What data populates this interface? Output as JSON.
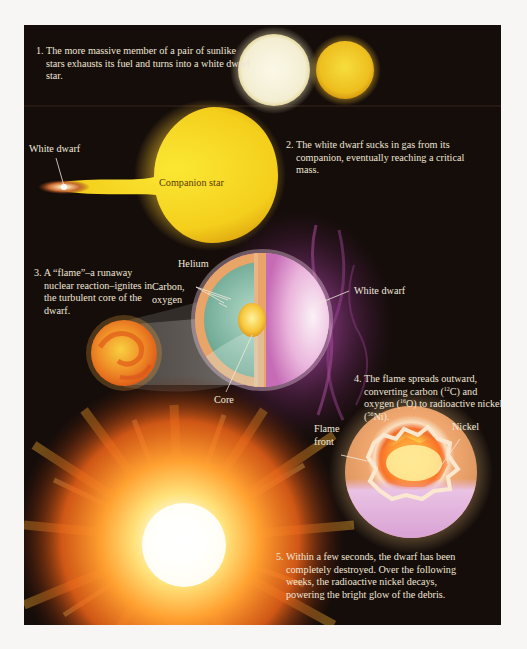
{
  "figure": {
    "colors": {
      "background": "#150d0a",
      "white_star": "#f6f2dc",
      "yellow_star": "#efc020",
      "helium_shell": "#e9a468",
      "carbon_oxygen_layer": "#7bb59e",
      "core": "#f5c640",
      "plasma_glow": "#d070c0",
      "explosion": "#ff7a1a"
    }
  },
  "steps": [
    {
      "number": "1.",
      "text": "The more massive member of a pair of sunlike stars exhausts its fuel and turns into a white dwarf star."
    },
    {
      "number": "2.",
      "text": "The white dwarf sucks in gas from its companion, eventually reaching a critical mass."
    },
    {
      "number": "3.",
      "text": "A “flame”–a runaway nuclear reaction–ignites in the turbulent core of the dwarf."
    },
    {
      "number": "4.",
      "text_before_c": "The flame spreads outward, converting carbon (",
      "c_iso": "12",
      "text_c": "C) and oxygen (",
      "o_iso": "16",
      "text_o": "O) to radioactive nickel (",
      "ni_iso": "56",
      "text_ni": "Ni)."
    },
    {
      "number": "5.",
      "text": "Within a few seconds, the dwarf has been completely destroyed. Over the following weeks, the radioactive nickel decays, powering the bright glow of the debris."
    }
  ],
  "labels": {
    "white_dwarf_top": "White dwarf",
    "companion_star": "Companion star",
    "helium": "Helium",
    "carbon_oxygen": "Carbon,\noxygen",
    "carbon": "Carbon,",
    "oxygen": "oxygen",
    "white_dwarf_right": "White dwarf",
    "core": "Core",
    "flame_front_1": "Flame",
    "flame_front_2": "front",
    "nickel": "Nickel"
  }
}
